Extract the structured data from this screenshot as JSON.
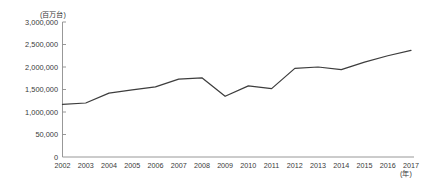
{
  "chart_data": {
    "type": "line",
    "title": "",
    "subtitle": "",
    "xlabel": "(年)",
    "ylabel": "(百万台)",
    "unit_note": "(百万台)",
    "x_unit_note": "(年)",
    "categories": [
      "2002",
      "2003",
      "2004",
      "2005",
      "2006",
      "2007",
      "2008",
      "2009",
      "2010",
      "2011",
      "2012",
      "2013",
      "2014",
      "2015",
      "2016",
      "2017"
    ],
    "values": [
      1170000,
      1200000,
      1420000,
      1490000,
      1560000,
      1730000,
      1760000,
      1350000,
      1580000,
      1520000,
      1970000,
      2000000,
      1940000,
      2110000,
      2250000,
      2370000
    ],
    "series": [
      {
        "name": "",
        "values": [
          1170000,
          1200000,
          1420000,
          1490000,
          1560000,
          1730000,
          1760000,
          1350000,
          1580000,
          1520000,
          1970000,
          2000000,
          1940000,
          2110000,
          2250000,
          2370000
        ]
      }
    ],
    "ylim": [
      0,
      3000000
    ],
    "xlim": [
      "2002",
      "2017"
    ],
    "y_ticks": [
      0,
      500000,
      1000000,
      1500000,
      2000000,
      2500000,
      3000000
    ],
    "y_tick_labels": [
      "0",
      "50,000",
      "1,000,000",
      "1,500,000",
      "2,000,000",
      "2,500,000",
      "3,000,000"
    ],
    "x_tick_labels": [
      "2002",
      "2003",
      "2004",
      "2005",
      "2006",
      "2007",
      "2008",
      "2009",
      "2010",
      "2011",
      "2012",
      "2013",
      "2014",
      "2015",
      "2016",
      "2017"
    ],
    "grid": false,
    "legend": null,
    "legend_position": "none",
    "line_color": "#3d3d3d",
    "axis_color": "#8c8c8c",
    "text_color": "#3a3a3a",
    "background_color": "#ffffff"
  }
}
